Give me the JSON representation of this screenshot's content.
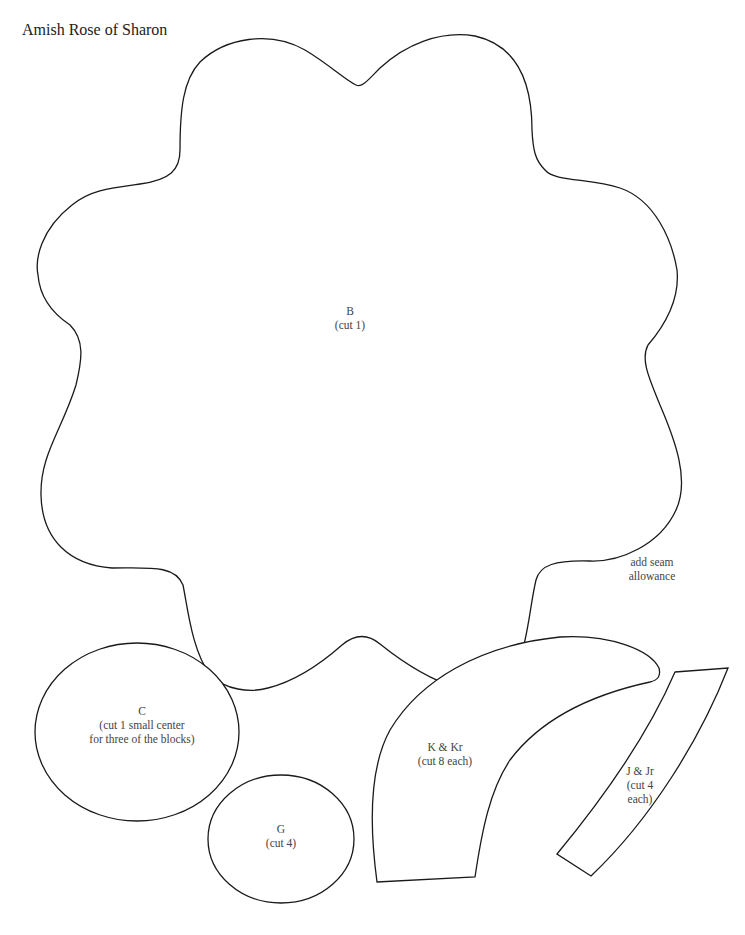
{
  "title": "Amish Rose of Sharon",
  "note": {
    "line1": "add seam",
    "line2": "allowance"
  },
  "pieces": {
    "B": {
      "letter": "B",
      "instruction": "(cut 1)"
    },
    "C": {
      "letter": "C",
      "instruction_line1": "(cut 1 small center",
      "instruction_line2": "for three of the blocks)"
    },
    "G": {
      "letter": "G",
      "instruction": "(cut 4)"
    },
    "K": {
      "letter": "K & Kr",
      "instruction": "(cut 8 each)"
    },
    "J": {
      "letter": "J & Jr",
      "instruction_line1": "(cut 4",
      "instruction_line2": "each)"
    }
  },
  "colors": {
    "outline": "#1a1a1a",
    "text": "#444444",
    "background": "#ffffff"
  }
}
